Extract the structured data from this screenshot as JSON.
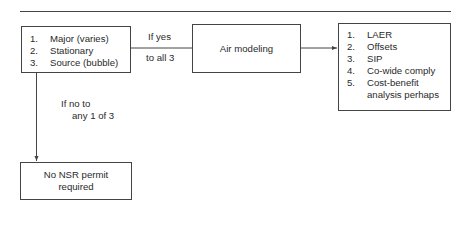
{
  "diagram": {
    "criteria_box": {
      "items": [
        {
          "num": "1.",
          "text": "Major (varies)"
        },
        {
          "num": "2.",
          "text": "Stationary"
        },
        {
          "num": "3.",
          "text": "Source (bubble)"
        }
      ]
    },
    "yes_edge_label": {
      "line1": "If yes",
      "line2": "to all 3"
    },
    "air_modeling_box": {
      "text": "Air modeling"
    },
    "requirements_box": {
      "items": [
        {
          "num": "1.",
          "text": "LAER"
        },
        {
          "num": "2.",
          "text": "Offsets"
        },
        {
          "num": "3.",
          "text": "SIP"
        },
        {
          "num": "4.",
          "text": "Co-wide comply"
        },
        {
          "num": "5.",
          "text": "Cost-benefit analysis perhaps"
        }
      ]
    },
    "no_edge_label": {
      "line1": "If no to",
      "line2": "any 1 of 3"
    },
    "no_permit_box": {
      "line1": "No NSR permit",
      "line2": "required"
    },
    "colors": {
      "stroke": "#444444",
      "text": "#2a2a2a",
      "background": "#ffffff"
    }
  }
}
